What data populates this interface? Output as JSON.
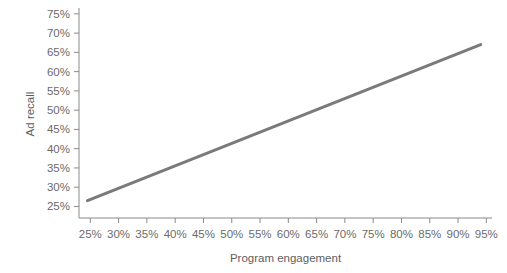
{
  "chart_data": {
    "type": "line",
    "title": "",
    "xlabel": "Program engagement",
    "ylabel": "Ad recall",
    "xlim": [
      23,
      96
    ],
    "ylim": [
      22,
      76
    ],
    "grid": false,
    "legend": null,
    "x_ticks": [
      "25%",
      "30%",
      "35%",
      "40%",
      "45%",
      "50%",
      "55%",
      "60%",
      "65%",
      "70%",
      "75%",
      "80%",
      "85%",
      "90%",
      "95%"
    ],
    "x_tick_values": [
      25,
      30,
      35,
      40,
      45,
      50,
      55,
      60,
      65,
      70,
      75,
      80,
      85,
      90,
      95
    ],
    "y_ticks": [
      "25%",
      "30%",
      "35%",
      "40%",
      "45%",
      "50%",
      "55%",
      "60%",
      "65%",
      "70%",
      "75%"
    ],
    "y_tick_values": [
      25,
      30,
      35,
      40,
      45,
      50,
      55,
      60,
      65,
      70,
      75
    ],
    "series": [
      {
        "name": "Ad recall vs Program engagement",
        "color": "#7a7a7a",
        "line_width": 3,
        "x": [
          24.5,
          94
        ],
        "values": [
          26.5,
          67
        ]
      }
    ]
  },
  "style": {
    "axis_color": "#8a8a8a",
    "tick_label_color": "#6b6b6b",
    "axis_title_color": "#5e5e5e",
    "background": "#ffffff"
  },
  "bleed_text": ""
}
